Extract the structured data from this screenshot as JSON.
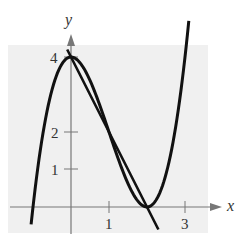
{
  "chart_data": {
    "type": "line",
    "title": "",
    "xlabel": "x",
    "ylabel": "y",
    "x_ticks": [
      1,
      3
    ],
    "y_ticks": [
      1,
      2,
      4
    ],
    "xlim": [
      -1.65,
      3.6
    ],
    "ylim": [
      -0.7,
      4.3
    ],
    "grid": false,
    "background_box_color": "#f0f0f0",
    "series": [
      {
        "name": "f(x) = x^3 - 3x^2 + 4",
        "kind": "cubic",
        "coeffs": [
          1,
          -3,
          0,
          4
        ],
        "x_range": [
          -1.05,
          3.1
        ],
        "color": "#111111"
      },
      {
        "name": "y = 4 - 2x",
        "kind": "line",
        "coeffs": [
          -2,
          4
        ],
        "x_range": [
          -0.1,
          2.3
        ],
        "color": "#111111"
      }
    ],
    "key_points": [
      {
        "x": 0,
        "y": 4
      },
      {
        "x": 2,
        "y": 0
      }
    ]
  },
  "labels": {
    "x_axis": "x",
    "y_axis": "y",
    "tick_x1": "1",
    "tick_x3": "3",
    "tick_y1": "1",
    "tick_y2": "2",
    "tick_y4": "4"
  }
}
